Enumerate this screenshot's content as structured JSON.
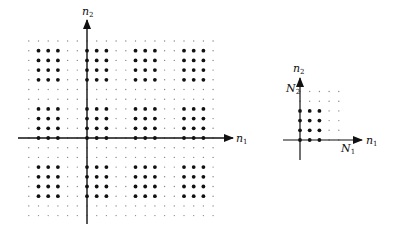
{
  "figure": {
    "left_plot": {
      "axis_x_label": "n",
      "axis_x_sub": "1",
      "axis_y_label": "n",
      "axis_y_sub": "2",
      "origin": [
        87,
        138
      ],
      "spacing": 9.7,
      "n1_range": [
        -6,
        13
      ],
      "n2_range": [
        -8,
        10
      ],
      "pattern": {
        "n1_period": 5,
        "n1_big": [
          0,
          1,
          2
        ],
        "n2_period": 6,
        "n2_big": [
          0,
          1,
          2,
          3
        ]
      }
    },
    "right_plot": {
      "axis_x_label": "n",
      "axis_x_sub": "1",
      "axis_y_label": "n",
      "axis_y_sub": "2",
      "tick_x_label": "N",
      "tick_x_sub": "1",
      "tick_y_label": "N",
      "tick_y_sub": "2",
      "origin": [
        300,
        140
      ],
      "spacing": 9.7,
      "n1_range": [
        0,
        4
      ],
      "n2_range": [
        0,
        5
      ],
      "pattern": {
        "n1_big": [
          0,
          1,
          2
        ],
        "n2_big": [
          0,
          1,
          2,
          3
        ]
      }
    }
  },
  "colors": {
    "ink": "#111111",
    "small_dot": "#888888"
  }
}
